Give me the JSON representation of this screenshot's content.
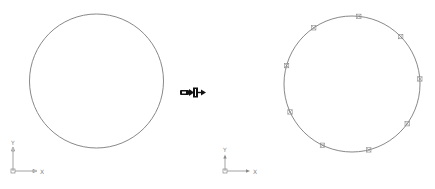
{
  "figure": {
    "colors": {
      "line": "#7a7a7a",
      "marker": "#8a8a8a",
      "arrow": "#111111",
      "background": "#ffffff"
    }
  },
  "left_view": {
    "circle": {
      "cx": 96.5,
      "cy": 81,
      "r": 67
    },
    "ucs": {
      "x_label": "X",
      "y_label": "Y"
    }
  },
  "transition_arrow": {
    "icon": "conversion-arrow-icon"
  },
  "right_view": {
    "circle": {
      "cx": 352,
      "cy": 84,
      "r": 68
    },
    "marker_count": 9,
    "marker_style": "boxed-x-point",
    "ucs": {
      "x_label": "X",
      "y_label": "Y"
    }
  }
}
